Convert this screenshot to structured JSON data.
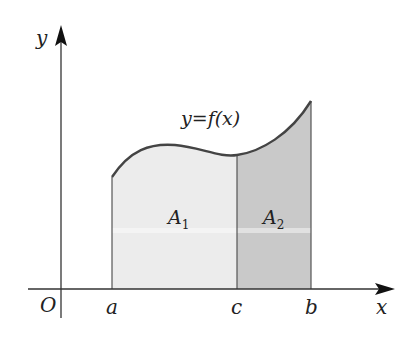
{
  "diagram": {
    "type": "definite-integral-area-split",
    "axes": {
      "x_label": "x",
      "y_label": "y",
      "origin_label": "O"
    },
    "curve_label": "y=f(x)",
    "points": {
      "a": "a",
      "c": "c",
      "b": "b"
    },
    "regions": [
      {
        "name": "A1",
        "label": "A",
        "subscript": "1",
        "from": "a",
        "to": "c",
        "fill": "#ececec"
      },
      {
        "name": "A2",
        "label": "A",
        "subscript": "2",
        "from": "c",
        "to": "b",
        "fill": "#c9c9c9"
      }
    ],
    "colors": {
      "axis": "#333333",
      "curve": "#444444"
    }
  }
}
